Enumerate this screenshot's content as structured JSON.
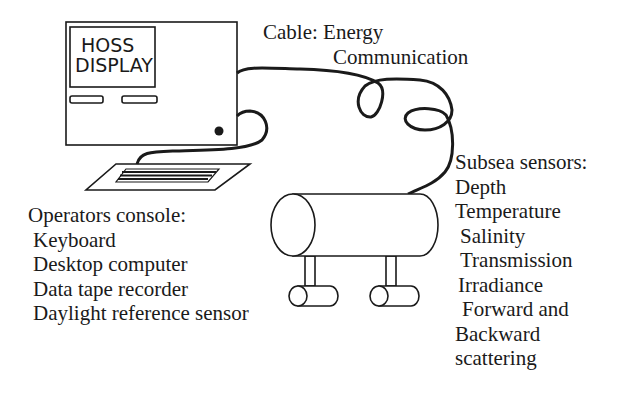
{
  "diagram": {
    "type": "system-schematic",
    "colors": {
      "ink": "#1a1a1a",
      "background": "#ffffff"
    },
    "monitor": {
      "screen_lines": [
        "HOSS",
        "DISPLAY"
      ]
    },
    "cable": {
      "label_line1": "Cable: Energy",
      "label_line2": "Communication"
    },
    "operators_console": {
      "title": "Operators console:",
      "items": [
        "Keyboard",
        "Desktop computer",
        "Data tape recorder",
        "Daylight reference sensor"
      ]
    },
    "subsea_sensors": {
      "title": "Subsea sensors:",
      "items": [
        "Depth",
        "Temperature",
        "Salinity",
        "Transmission",
        "Irradiance",
        "Forward and",
        "Backward",
        "scattering"
      ]
    }
  }
}
